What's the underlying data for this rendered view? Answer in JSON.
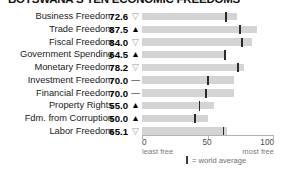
{
  "chart_data": {
    "type": "bar",
    "title": "BOTSWANA'S TEN ECONOMIC FREEDOMS",
    "xlabel": "",
    "ylabel": "",
    "xlim": [
      0,
      100
    ],
    "grid": false,
    "orientation": "horizontal",
    "axis": {
      "ticks": [
        {
          "value": 0,
          "label": "0",
          "sub": "least free"
        },
        {
          "value": 50,
          "label": "50",
          "sub": ""
        },
        {
          "value": 100,
          "label": "100",
          "sub": "most free"
        }
      ]
    },
    "legend": {
      "position": "bottom-center",
      "swatch": "vertical-bar-marker",
      "text": "= world average"
    },
    "categories": [
      "Business Freedom",
      "Trade Freedom",
      "Fiscal Freedom",
      "Government Spending",
      "Monetary Freedom",
      "Investment Freedom",
      "Financial Freedom",
      "Property Rights",
      "Fdm. from Corruption",
      "Labor Freedom"
    ],
    "values": [
      72.6,
      87.5,
      84.0,
      64.5,
      78.2,
      70.0,
      70.0,
      55.0,
      50.0,
      65.1
    ],
    "value_labels": [
      "72.6",
      "87.5",
      "84.0",
      "64.5",
      "78.2",
      "70.0",
      "70.0",
      "55.0",
      "50.0",
      "65.1"
    ],
    "trend": [
      "down",
      "up",
      "down",
      "up",
      "down",
      "flat",
      "flat",
      "up",
      "up",
      "down"
    ],
    "trend_glyphs": [
      "▽",
      "▲",
      "▽",
      "▲",
      "▽",
      "—",
      "—",
      "▲",
      "▲",
      "▽"
    ],
    "world_average": [
      64.3,
      74.8,
      76.3,
      63.5,
      73.4,
      50.2,
      49.0,
      43.8,
      40.5,
      62.1
    ],
    "series": [
      {
        "name": "Botswana score",
        "values": [
          72.6,
          87.5,
          84.0,
          64.5,
          78.2,
          70.0,
          70.0,
          55.0,
          50.0,
          65.1
        ]
      },
      {
        "name": "world average",
        "values": [
          64.3,
          74.8,
          76.3,
          63.5,
          73.4,
          50.2,
          49.0,
          43.8,
          40.5,
          62.1
        ]
      }
    ]
  },
  "colors": {
    "bar": "#d4d4d4",
    "avg_tick": "#2b2b2b",
    "axis": "#b4b4b4",
    "text": "#1a1a1a",
    "muted": "#7a7a7a",
    "trend_down": "#9a9a9a"
  }
}
